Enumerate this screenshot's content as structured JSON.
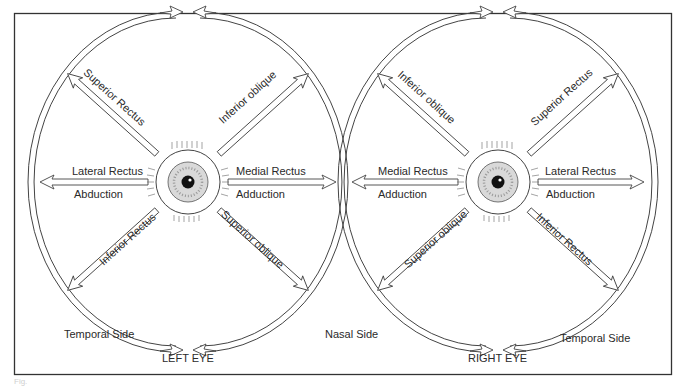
{
  "figure": {
    "caption_faint": "Fig.",
    "frame_color": "#333333",
    "line_color": "#444444"
  },
  "left_eye": {
    "title": "LEFT EYE",
    "side_left": "Temporal Side",
    "side_right": "Nasal Side",
    "muscles": {
      "upper_left": "Superior Rectus",
      "upper_right": "Inferior oblique",
      "left": "Lateral Rectus",
      "left_action": "Abduction",
      "right": "Medial Rectus",
      "right_action": "Adduction",
      "lower_left": "Inferior Rectus",
      "lower_right": "Superior oblique"
    }
  },
  "right_eye": {
    "title": "RIGHT EYE",
    "side_right": "Temporal Side",
    "muscles": {
      "upper_left": "Inferior oblique",
      "upper_right": "Superior Rectus",
      "left": "Medial Rectus",
      "left_action": "Adduction",
      "right": "Lateral Rectus",
      "right_action": "Abduction",
      "lower_left": "Superior oblique",
      "lower_right": "Inferior Rectus"
    }
  }
}
